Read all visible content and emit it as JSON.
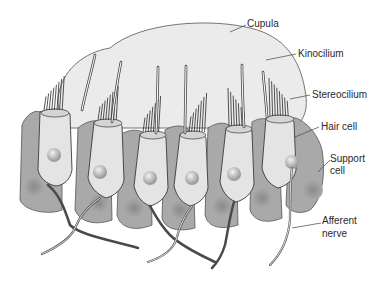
{
  "labels": {
    "cupula": "Cupula",
    "kinocilium": "Kinocilium",
    "stereocilium": "Stereocilium",
    "hair_cell": "Hair cell",
    "support_cell_1": "Support",
    "support_cell_2": "cell",
    "afferent_nerve_1": "Afferent",
    "afferent_nerve_2": "nerve"
  },
  "colors": {
    "cupula": "#ebebeb",
    "support": "#a9a9a9",
    "hair_cell": "#e4e4e4",
    "outline": "#3a3a3a",
    "nucleus": "#bdbdbd",
    "nerve_dark": "#4a4a4a"
  }
}
